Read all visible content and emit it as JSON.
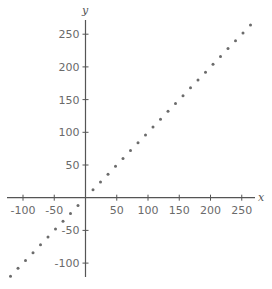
{
  "chart_data": {
    "type": "scatter",
    "title": "",
    "xlabel": "x",
    "ylabel": "y",
    "xlim": [
      -130,
      270
    ],
    "ylim": [
      -125,
      270
    ],
    "grid": false,
    "legend": null,
    "x_ticks": [
      -100,
      -50,
      50,
      100,
      150,
      200,
      250
    ],
    "y_ticks": [
      250,
      200,
      150,
      100,
      50,
      -50,
      -100
    ],
    "x_tick_labels": [
      "-100",
      "-50",
      "50",
      "100",
      "150",
      "200",
      "250"
    ],
    "y_tick_labels": [
      "250",
      "200",
      "150",
      "100",
      "50",
      "-50",
      "-100"
    ],
    "series": [
      {
        "name": "y = x",
        "color": "#6b6b6b",
        "x": [
          -120,
          -108,
          -96,
          -84,
          -72,
          -60,
          -48,
          -36,
          -24,
          -12,
          12,
          24,
          36,
          48,
          60,
          72,
          84,
          96,
          108,
          120,
          132,
          144,
          156,
          168,
          180,
          192,
          204,
          216,
          228,
          240,
          252,
          264
        ],
        "y": [
          -120,
          -108,
          -96,
          -84,
          -72,
          -60,
          -48,
          -36,
          -24,
          -12,
          12,
          24,
          36,
          48,
          60,
          72,
          84,
          96,
          108,
          120,
          132,
          144,
          156,
          168,
          180,
          192,
          204,
          216,
          228,
          240,
          252,
          264
        ]
      }
    ]
  },
  "colors": {
    "axis": "#555555",
    "labels": "#6a6a6a",
    "points": "#6b6b6b"
  }
}
